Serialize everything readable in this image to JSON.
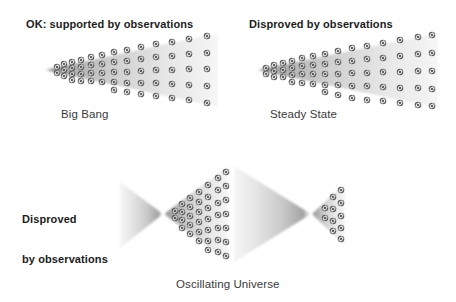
{
  "figure": {
    "title_left": "OK: supported by observations",
    "title_right": "Disproved by observations",
    "label_big_bang": "Big Bang",
    "label_steady_state": "Steady State",
    "label_disproved_line1": "Disproved",
    "label_disproved_line2": "by observations",
    "label_oscillating": "Oscillating Universe",
    "background_color": "#ffffff",
    "text_color": "#1c1c1c",
    "cone_light_color": "#f2f2f2",
    "cone_mid_color": "#bfbfbf",
    "cone_dark_color": "#8e8e8e",
    "galaxy_color": "#4a4a4a",
    "icon_names": [
      "galaxy-spiral-icon",
      "expanding-cone-shape",
      "contracting-cone-shape"
    ]
  },
  "panels": [
    {
      "id": "big-bang",
      "heading": "OK: supported by observations",
      "caption": "Big Bang",
      "verdict": "supported",
      "cone_direction": "expanding",
      "has_galaxies": true,
      "galaxy_density": "decreasing-over-time"
    },
    {
      "id": "steady-state",
      "heading": "Disproved by observations",
      "caption": "Steady State",
      "verdict": "disproved",
      "cone_direction": "expanding",
      "has_galaxies": true,
      "galaxy_density": "constant"
    },
    {
      "id": "oscillating-universe",
      "heading": "Disproved by observations",
      "caption": "Oscillating Universe",
      "verdict": "disproved",
      "cone_direction": "contract-expand-contract-expand",
      "has_galaxies": true,
      "galaxy_density": "cyclic"
    }
  ]
}
